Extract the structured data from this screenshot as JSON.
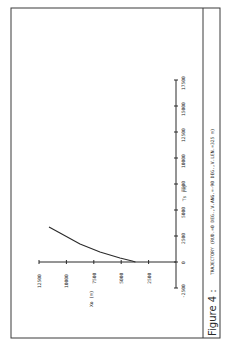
{
  "figure": {
    "label": "Figure 4 :",
    "caption": "TRAJECTORY (RUD.=0 DEG.,V.ANG.=-90 DEG.,V.LEN.=325 m)",
    "orientation": "rotated 90 degrees counter-clockwise on page",
    "colors": {
      "ink": "#2a2a2a",
      "frame": "#3a3a3a",
      "paper": "#ffffff"
    }
  },
  "chart_data": {
    "type": "line",
    "title": "TRAJECTORY (RUD.=0 DEG.,V.ANG.=-90 DEG.,V.LEN.=325 m)",
    "xlabel": "Ts (m)",
    "ylabel": "Xo (m)",
    "xlim": [
      -2500,
      17500
    ],
    "ylim": [
      0,
      12500
    ],
    "x_ticks": [
      0,
      2500,
      5000,
      7500,
      10000,
      12500,
      15000,
      17500
    ],
    "x_tick_labels": [
      "0",
      "2500",
      "5000",
      "7500",
      "10000",
      "12500",
      "15000",
      "17500"
    ],
    "x_extra_tick_labels": [
      "-2500"
    ],
    "y_ticks": [
      2500,
      5000,
      7500,
      10000,
      12500
    ],
    "y_tick_labels": [
      "2500",
      "5000",
      "7500",
      "10000",
      "12500"
    ],
    "grid": false,
    "legend": null,
    "series": [
      {
        "name": "trajectory",
        "x": [
          0,
          100,
          385,
          960,
          1730,
          2790,
          3365
        ],
        "y": [
          3700,
          4000,
          5110,
          6930,
          8760,
          10580,
          11590
        ]
      }
    ]
  }
}
